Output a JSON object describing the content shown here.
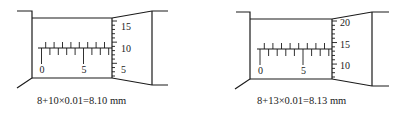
{
  "figures": [
    {
      "id": "left",
      "sleeve_labels": [
        "0",
        "5"
      ],
      "thimble_labels": [
        "15",
        "10",
        "5"
      ],
      "caption": "8+10×0.01=8.10 mm",
      "reading_mm": 8.1,
      "main_scale_mm": 8,
      "thimble_division": 10
    },
    {
      "id": "right",
      "sleeve_labels": [
        "0",
        "5"
      ],
      "thimble_labels": [
        "20",
        "15",
        "10"
      ],
      "caption": "8+13×0.01=8.13 mm",
      "reading_mm": 8.13,
      "main_scale_mm": 8,
      "thimble_division": 13
    }
  ]
}
